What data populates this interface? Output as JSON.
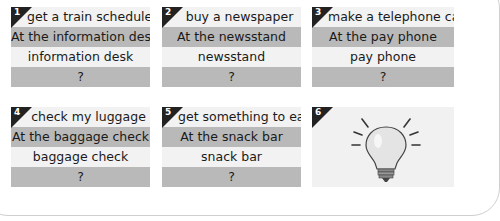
{
  "cards": [
    {
      "number": "1",
      "activity": "get a train schedule",
      "answer": "At the information desk",
      "place": "information desk",
      "prompt": "?"
    },
    {
      "number": "2",
      "activity": "buy a newspaper",
      "answer": "At the newsstand",
      "place": "newsstand",
      "prompt": "?"
    },
    {
      "number": "3",
      "activity": "make a telephone call",
      "answer": "At the pay phone",
      "place": "pay phone",
      "prompt": "?"
    },
    {
      "number": "4",
      "activity": "check my luggage",
      "answer": "At the baggage check",
      "place": "baggage check",
      "prompt": "?"
    },
    {
      "number": "5",
      "activity": "get something to eat",
      "answer": "At the snack bar",
      "place": "snack bar",
      "prompt": "?"
    },
    {
      "number": "6",
      "icon": "lightbulb-icon"
    }
  ],
  "colors": {
    "light_row": "#f2f2f2",
    "gray_row": "#b9b9b9",
    "badge": "#222222"
  }
}
